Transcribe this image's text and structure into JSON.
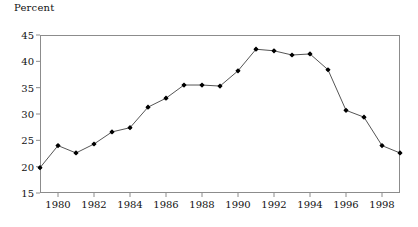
{
  "chart_data": {
    "type": "line",
    "title": "",
    "subtitle": "",
    "xlabel": "",
    "ylabel": "Percent",
    "ylim": [
      15,
      45
    ],
    "xlim": [
      1979,
      1999
    ],
    "yticks": [
      15,
      20,
      25,
      30,
      35,
      40,
      45
    ],
    "xticks": [
      1980,
      1982,
      1984,
      1986,
      1988,
      1990,
      1992,
      1994,
      1996,
      1998
    ],
    "ytick_labels": [
      "15",
      "20",
      "25",
      "30",
      "35",
      "40",
      "45"
    ],
    "xtick_labels": [
      "1980",
      "1982",
      "1984",
      "1986",
      "1988",
      "1990",
      "1992",
      "1994",
      "1996",
      "1998"
    ],
    "grid": false,
    "legend": false,
    "legend_position": "none",
    "marker": "diamond",
    "line_color": "#555555",
    "marker_color": "#000000",
    "x": [
      1979,
      1980,
      1981,
      1982,
      1983,
      1984,
      1985,
      1986,
      1987,
      1988,
      1989,
      1990,
      1991,
      1992,
      1993,
      1994,
      1995,
      1996,
      1997,
      1998,
      1999
    ],
    "values": [
      19.8,
      24.0,
      22.6,
      24.3,
      26.6,
      27.4,
      31.3,
      33.0,
      35.5,
      35.5,
      35.3,
      38.2,
      42.3,
      42.0,
      41.2,
      41.4,
      38.4,
      30.7,
      29.4,
      24.0,
      22.6
    ],
    "series": [
      {
        "name": "Percent",
        "x": [
          1979,
          1980,
          1981,
          1982,
          1983,
          1984,
          1985,
          1986,
          1987,
          1988,
          1989,
          1990,
          1991,
          1992,
          1993,
          1994,
          1995,
          1996,
          1997,
          1998,
          1999
        ],
        "values": [
          19.8,
          24.0,
          22.6,
          24.3,
          26.6,
          27.4,
          31.3,
          33.0,
          35.5,
          35.5,
          35.3,
          38.2,
          42.3,
          42.0,
          41.2,
          41.4,
          38.4,
          30.7,
          29.4,
          24.0,
          22.6
        ]
      }
    ]
  }
}
